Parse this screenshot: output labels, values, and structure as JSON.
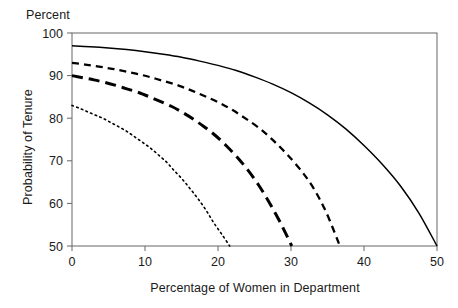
{
  "chart_data": {
    "type": "line",
    "title": "",
    "unit_label": "Percent",
    "xlabel": "Percentage of Women in Department",
    "ylabel": "Probability of Tenure",
    "xlim": [
      0,
      50
    ],
    "ylim": [
      50,
      100
    ],
    "xticks": [
      0,
      10,
      20,
      30,
      40,
      50
    ],
    "yticks": [
      50,
      60,
      70,
      80,
      90,
      100
    ],
    "xticklabels": [
      "0",
      "10",
      "20",
      "30",
      "40",
      "50"
    ],
    "yticklabels": [
      "50",
      "60",
      "70",
      "80",
      "90",
      "100"
    ],
    "grid": false,
    "legend": "none",
    "frame": "box",
    "series": [
      {
        "name": "solid-curve",
        "style": "solid",
        "color": "#000000",
        "x": [
          0,
          2.5,
          5,
          7.5,
          10,
          12.5,
          15,
          17.5,
          20,
          22.5,
          25,
          27.5,
          30,
          32.5,
          35,
          37.5,
          40,
          42.5,
          45,
          47.5,
          50
        ],
        "y": [
          97.0,
          96.8,
          96.5,
          96.1,
          95.6,
          95.0,
          94.3,
          93.4,
          92.4,
          91.2,
          89.7,
          88.0,
          86.0,
          83.6,
          80.8,
          77.5,
          73.6,
          69.2,
          64.1,
          57.8,
          50.0
        ]
      },
      {
        "name": "short-dash-curve",
        "style": "dashed-medium",
        "color": "#000000",
        "x": [
          0,
          1.8,
          3.7,
          5.5,
          7.3,
          9.2,
          11.0,
          12.8,
          14.7,
          16.5,
          18.3,
          20.2,
          22.0,
          23.8,
          25.7,
          27.5,
          29.3,
          31.2,
          33.0,
          34.8,
          36.7
        ],
        "y": [
          93.0,
          92.6,
          92.1,
          91.6,
          91.0,
          90.3,
          89.5,
          88.6,
          87.6,
          86.4,
          85.1,
          83.6,
          81.9,
          79.9,
          77.6,
          74.9,
          71.8,
          68.1,
          63.8,
          58.0,
          50.0
        ]
      },
      {
        "name": "long-dash-curve",
        "style": "dashed-long",
        "color": "#000000",
        "x": [
          0,
          1.5,
          3.0,
          4.5,
          6.0,
          7.5,
          9.0,
          10.5,
          12.0,
          13.6,
          15.1,
          16.6,
          18.1,
          19.6,
          21.1,
          22.6,
          24.1,
          25.6,
          27.1,
          28.6,
          30.1
        ],
        "y": [
          90.0,
          89.5,
          89.0,
          88.4,
          87.7,
          86.9,
          86.1,
          85.1,
          84.0,
          82.8,
          81.4,
          79.8,
          78.0,
          76.0,
          73.6,
          70.9,
          67.8,
          64.2,
          60.0,
          55.3,
          50.0
        ]
      },
      {
        "name": "dotted-curve",
        "style": "dotted",
        "color": "#000000",
        "x": [
          0,
          1.08,
          2.16,
          3.24,
          4.32,
          5.4,
          6.5,
          7.6,
          8.6,
          9.7,
          10.8,
          11.9,
          13.0,
          14.0,
          15.1,
          16.2,
          17.3,
          18.4,
          19.4,
          20.5,
          21.6
        ],
        "y": [
          83.0,
          82.3,
          81.5,
          80.7,
          79.9,
          78.9,
          77.9,
          76.8,
          75.6,
          74.3,
          72.9,
          71.3,
          69.6,
          67.7,
          65.7,
          63.4,
          61.0,
          58.3,
          55.5,
          52.8,
          50.0
        ]
      }
    ]
  }
}
